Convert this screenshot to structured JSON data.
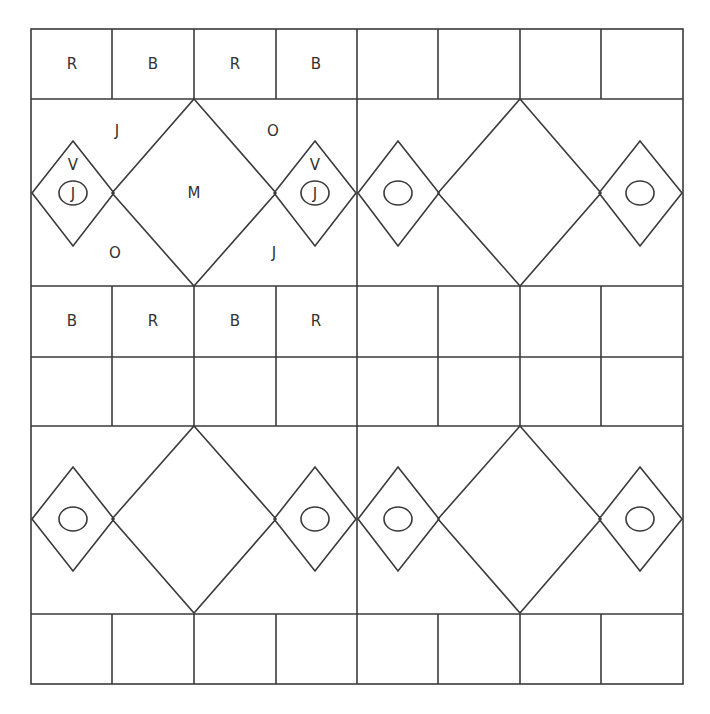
{
  "colors": {
    "stroke": "#3a3a3a",
    "text": "#333333",
    "background": "#ffffff"
  },
  "grid": {
    "columns_x": [
      31,
      112,
      194,
      276,
      357,
      438,
      520,
      601,
      683
    ],
    "rows_y": [
      29,
      99,
      286,
      357,
      426,
      614,
      684
    ]
  },
  "top_row_labels": [
    "R",
    "B",
    "R",
    "B",
    "",
    "",
    "",
    ""
  ],
  "third_row_labels": [
    "B",
    "R",
    "B",
    "R",
    "",
    "",
    "",
    ""
  ],
  "fourth_row_labels": [
    "",
    "",
    "",
    "",
    "",
    "",
    "",
    ""
  ],
  "bottom_row_labels": [
    "",
    "",
    "",
    "",
    "",
    "",
    "",
    ""
  ],
  "band1": {
    "center_label": "M",
    "corner_labels": [
      {
        "text": "J",
        "x": 117,
        "y": 131
      },
      {
        "text": "O",
        "x": 273,
        "y": 131
      },
      {
        "text": "O",
        "x": 115,
        "y": 253
      },
      {
        "text": "J",
        "x": 274,
        "y": 253
      }
    ],
    "small_diamond_labels": [
      {
        "top": "V",
        "oval": "J"
      },
      {
        "top": "V",
        "oval": "J"
      },
      {
        "top": "",
        "oval": ""
      },
      {
        "top": "",
        "oval": ""
      }
    ]
  },
  "band2": {
    "center_label": "",
    "small_diamond_labels": [
      {
        "top": "",
        "oval": ""
      },
      {
        "top": "",
        "oval": ""
      },
      {
        "top": "",
        "oval": ""
      },
      {
        "top": "",
        "oval": ""
      }
    ]
  }
}
